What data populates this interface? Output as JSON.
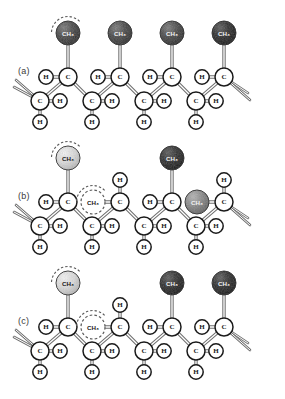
{
  "figure": {
    "background_color": "#ffffff"
  },
  "colors": {
    "bond": "#4a4a4a",
    "atom_outline": "#1a1a1a",
    "atom_fill": "#ffffff",
    "sphere_dark": "#3b3b3b",
    "sphere_darker": "#222222",
    "sphere_mid": "#7d7d7d",
    "sphere_light": "#d8d8d8",
    "label_text": "#3a3a3a",
    "dashed_outline": "#5a5a5a"
  },
  "atom_labels": {
    "carbon": "C",
    "hydrogen": "H",
    "methyl": "CH3",
    "methyl_display": "CH₃"
  },
  "panels": [
    {
      "id": "a",
      "label": "(a)",
      "label_x": 18,
      "label_y": 66,
      "origin_y": 0,
      "units": [
        {
          "index": 0,
          "methyl_position": "up",
          "methyl_shade": "sphere_dark",
          "methyl_dashed": false,
          "rotation_arc": true,
          "upper_h": "left"
        },
        {
          "index": 1,
          "methyl_position": "up",
          "methyl_shade": "sphere_dark",
          "methyl_dashed": false,
          "rotation_arc": false,
          "upper_h": "left"
        },
        {
          "index": 2,
          "methyl_position": "up",
          "methyl_shade": "sphere_dark",
          "methyl_dashed": false,
          "rotation_arc": false,
          "upper_h": "left"
        },
        {
          "index": 3,
          "methyl_position": "up",
          "methyl_shade": "sphere_darker",
          "methyl_dashed": false,
          "rotation_arc": false,
          "upper_h": "left"
        }
      ]
    },
    {
      "id": "b",
      "label": "(b)",
      "label_x": 18,
      "label_y": 191,
      "origin_y": 125,
      "units": [
        {
          "index": 0,
          "methyl_position": "up",
          "methyl_shade": "sphere_light",
          "methyl_dashed": false,
          "rotation_arc": true,
          "upper_h": "left"
        },
        {
          "index": 1,
          "methyl_position": "side",
          "methyl_shade": "none",
          "methyl_dashed": true,
          "rotation_arc": true,
          "upper_h": "top"
        },
        {
          "index": 2,
          "methyl_position": "up",
          "methyl_shade": "sphere_darker",
          "methyl_dashed": false,
          "rotation_arc": false,
          "upper_h": "left"
        },
        {
          "index": 3,
          "methyl_position": "side",
          "methyl_shade": "sphere_mid",
          "methyl_dashed": false,
          "rotation_arc": false,
          "upper_h": "top"
        }
      ]
    },
    {
      "id": "c",
      "label": "(c)",
      "label_x": 18,
      "label_y": 316,
      "origin_y": 250,
      "units": [
        {
          "index": 0,
          "methyl_position": "up",
          "methyl_shade": "sphere_light",
          "methyl_dashed": false,
          "rotation_arc": true,
          "upper_h": "left"
        },
        {
          "index": 1,
          "methyl_position": "side",
          "methyl_shade": "none",
          "methyl_dashed": true,
          "rotation_arc": true,
          "upper_h": "top"
        },
        {
          "index": 2,
          "methyl_position": "up",
          "methyl_shade": "sphere_darker",
          "methyl_dashed": false,
          "rotation_arc": false,
          "upper_h": "left"
        },
        {
          "index": 3,
          "methyl_position": "up",
          "methyl_shade": "sphere_darker",
          "methyl_dashed": false,
          "rotation_arc": false,
          "upper_h": "left"
        }
      ]
    }
  ],
  "geometry": {
    "unit_spacing": 52,
    "first_top_x": 68,
    "top_row_y": 77,
    "bottom_row_y": 101,
    "bottom_offset_x": -28,
    "methyl_up_y": 33,
    "methyl_side_dx": -27,
    "h_top_left_dx": -22,
    "h_upper_top_dy": -22,
    "h_bottom_right_dx": 20,
    "h_bottom_down_dy": 21,
    "atom_radius": 9,
    "h_radius": 7.2,
    "methyl_radius": 12
  }
}
